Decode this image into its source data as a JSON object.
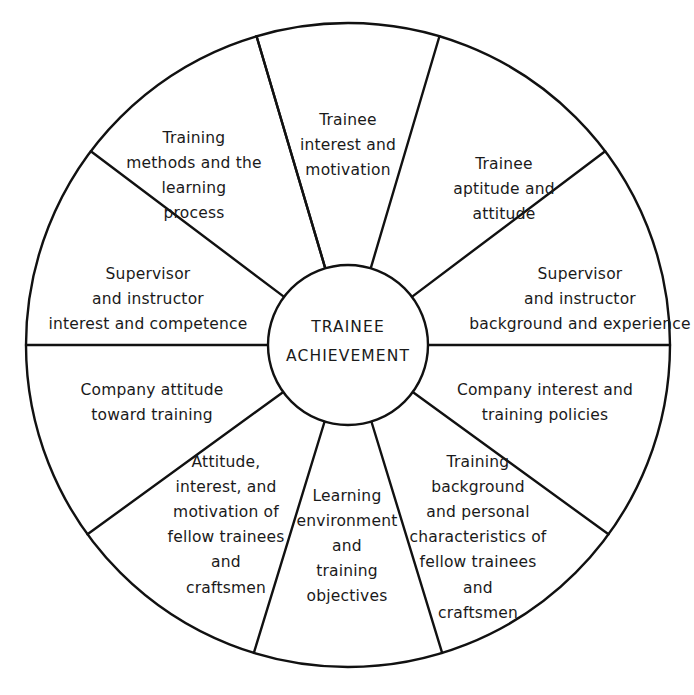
{
  "diagram": {
    "type": "wheel-spoke",
    "hub": {
      "label": "TRAINEE\nACHIEVEMENT",
      "line1": "TRAINEE",
      "line2": "ACHIEVEMENT"
    },
    "geometry": {
      "center_x": 348,
      "center_y": 345,
      "outer_radius": 322,
      "hub_radius": 80,
      "segment_count": 10
    },
    "colors": {
      "stroke": "#111111",
      "background": "#ffffff",
      "text": "#1a1a1a"
    },
    "segments": [
      {
        "id": "trainee-interest-and-motivation",
        "label": "Trainee\ninterest and\nmotivation",
        "start_angle": -106.5,
        "end_angle": -73.5,
        "text_x": 348,
        "text_y": 108,
        "text_width": 180
      },
      {
        "id": "trainee-aptitude-and-attitude",
        "label": "Trainee\naptitude and\nattitude",
        "start_angle": -73.5,
        "end_angle": -37,
        "text_x": 504,
        "text_y": 152,
        "text_width": 168
      },
      {
        "id": "supervisor-and-instructor-background-and-experience",
        "label": "Supervisor\nand instructor\nbackground and experience",
        "start_angle": -37,
        "end_angle": 0,
        "text_x": 580,
        "text_y": 262,
        "text_width": 228
      },
      {
        "id": "company-interest-and-training-policies",
        "label": "Company interest and\ntraining policies",
        "start_angle": 0,
        "end_angle": 36,
        "text_x": 545,
        "text_y": 378,
        "text_width": 220
      },
      {
        "id": "training-background-characteristics-fellow-trainees-craftsmen",
        "label": "Training\nbackground\nand personal\ncharacteristics of\nfellow trainees\nand\ncraftsmen",
        "start_angle": 36,
        "end_angle": 73,
        "text_x": 478,
        "text_y": 450,
        "text_width": 190
      },
      {
        "id": "learning-environment-and-training-objectives",
        "label": "Learning\nenvironment\nand\ntraining\nobjectives",
        "start_angle": 73,
        "end_angle": 107,
        "text_x": 347,
        "text_y": 484,
        "text_width": 150
      },
      {
        "id": "attitude-interest-motivation-of-fellow-trainees-craftsmen",
        "label": "Attitude,\ninterest, and\nmotivation of\nfellow trainees\nand\ncraftsmen",
        "start_angle": 107,
        "end_angle": 144,
        "text_x": 226,
        "text_y": 450,
        "text_width": 190
      },
      {
        "id": "company-attitude-toward-training",
        "label": "Company attitude\ntoward training",
        "start_angle": 144,
        "end_angle": 180,
        "text_x": 152,
        "text_y": 378,
        "text_width": 220
      },
      {
        "id": "supervisor-and-instructor-interest-and-competence",
        "label": "Supervisor\nand instructor\ninterest and competence",
        "start_angle": 180,
        "end_angle": 217,
        "text_x": 148,
        "text_y": 262,
        "text_width": 232
      },
      {
        "id": "training-methods-and-the-learning-process",
        "label": "Training\nmethods and the\nlearning\nprocess",
        "start_angle": 217,
        "end_angle": 253.5,
        "text_x": 194,
        "text_y": 126,
        "text_width": 192
      }
    ]
  }
}
